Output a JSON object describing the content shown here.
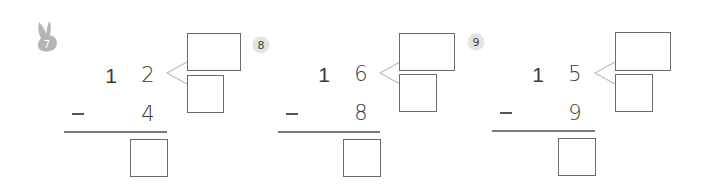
{
  "problems": [
    {
      "number": "7",
      "badge_style": "rabbit",
      "tens": "1",
      "ones": "2",
      "operator": "−",
      "subtrahend": "4",
      "answer_boxes": {
        "decompose_top": "",
        "decompose_bottom": "",
        "result": ""
      }
    },
    {
      "number": "8",
      "badge_style": "circle",
      "tens": "1",
      "ones": "6",
      "operator": "−",
      "subtrahend": "8",
      "answer_boxes": {
        "decompose_top": "",
        "decompose_bottom": "",
        "result": ""
      }
    },
    {
      "number": "9",
      "badge_style": "circle",
      "tens": "1",
      "ones": "5",
      "operator": "−",
      "subtrahend": "9",
      "answer_boxes": {
        "decompose_top": "",
        "decompose_bottom": "",
        "result": ""
      }
    }
  ],
  "colors": {
    "badge_bg": "#e3e3e3",
    "rabbit": "#b5b5b5",
    "box_border": "#6b6b6b",
    "connector": "#bdbdbd"
  }
}
